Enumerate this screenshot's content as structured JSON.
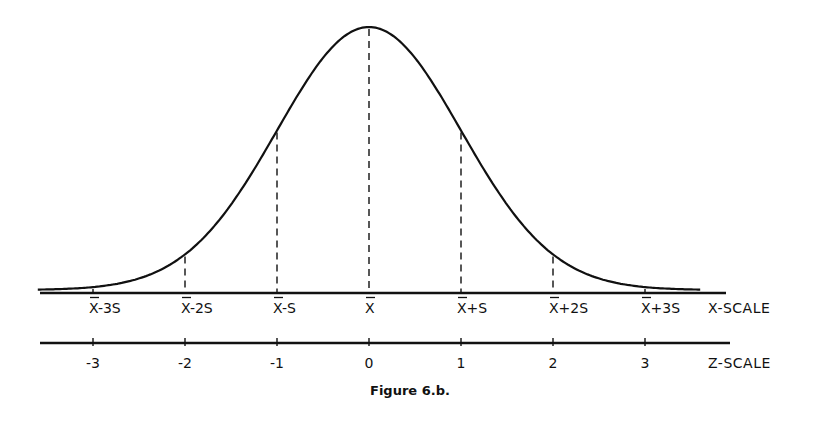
{
  "chart_data": {
    "type": "line",
    "title": "Figure 6.b.",
    "curve": "normal density",
    "mean_z": 0,
    "sd_z": 1,
    "x_range_z": [
      -3.6,
      3.6
    ],
    "grid": false,
    "legend": null,
    "dashed_verticals_at_z": [
      -3,
      -2,
      -1,
      0,
      1,
      2,
      3
    ],
    "x_scale": {
      "label": "X-SCALE",
      "ticks": [
        "X̄-3S",
        "X̄-2S",
        "X̄-S",
        "X̄",
        "X̄+S",
        "X̄+2S",
        "X̄+3S"
      ]
    },
    "z_scale": {
      "label": "Z-SCALE",
      "ticks": [
        "-3",
        "-2",
        "-1",
        "0",
        "1",
        "2",
        "3"
      ],
      "values": [
        -3,
        -2,
        -1,
        0,
        1,
        2,
        3
      ]
    }
  },
  "caption": "Figure 6.b.",
  "x_scale_label": "X-SCALE",
  "z_scale_label": "Z-SCALE",
  "x_ticks": [
    {
      "base": "X",
      "suffix": "-3S"
    },
    {
      "base": "X",
      "suffix": "-2S"
    },
    {
      "base": "X",
      "suffix": "-S"
    },
    {
      "base": "X",
      "suffix": ""
    },
    {
      "base": "X",
      "suffix": "+S"
    },
    {
      "base": "X",
      "suffix": "+2S"
    },
    {
      "base": "X",
      "suffix": "+3S"
    }
  ],
  "z_ticks": [
    "-3",
    "-2",
    "-1",
    "0",
    "1",
    "2",
    "3"
  ]
}
